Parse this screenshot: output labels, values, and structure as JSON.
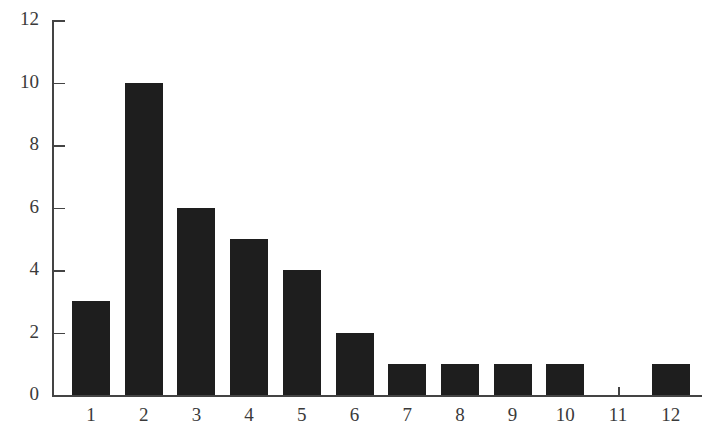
{
  "chart_data": {
    "type": "bar",
    "title": "",
    "xlabel": "",
    "ylabel": "",
    "categories": [
      "1",
      "2",
      "3",
      "4",
      "5",
      "6",
      "7",
      "8",
      "9",
      "10",
      "11",
      "12"
    ],
    "values": [
      3,
      10,
      6,
      5,
      4,
      2,
      1,
      1,
      1,
      1,
      0,
      1
    ],
    "ylim": [
      0,
      12
    ],
    "yticks": [
      "0",
      "2",
      "4",
      "6",
      "8",
      "10",
      "12"
    ],
    "grid": false,
    "legend": null,
    "bar_color": "#1e1e1e"
  }
}
